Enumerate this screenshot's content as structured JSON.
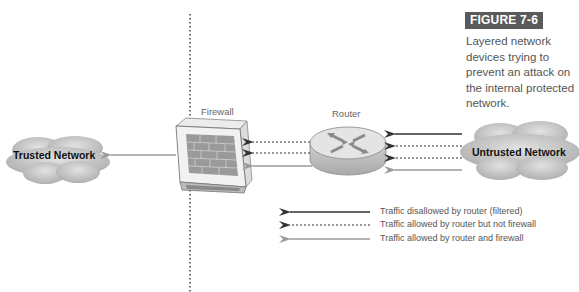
{
  "figure": {
    "label": "FIGURE 7-6",
    "caption": "Layered network devices trying to prevent an attack on the internal protected network."
  },
  "nodes": {
    "trusted_network": {
      "label": "Trusted Network",
      "icon": "cloud-icon"
    },
    "firewall": {
      "label": "Firewall",
      "icon": "firewall-brick-wall-icon"
    },
    "router": {
      "label": "Router",
      "icon": "router-icon"
    },
    "untrusted_network": {
      "label": "Untrusted Network",
      "icon": "cloud-icon"
    }
  },
  "legend": [
    {
      "label": "Traffic disallowed by router (filtered)",
      "style": "solid",
      "color": "#333333"
    },
    {
      "label": "Traffic allowed by router but not firewall",
      "style": "dashed",
      "color": "#333333"
    },
    {
      "label": "Traffic allowed by router and firewall",
      "style": "solid",
      "color": "#999999"
    }
  ],
  "flows": {
    "untrusted_to_router": [
      "disallowed",
      "allowed_not_firewall",
      "allowed_not_firewall",
      "allowed_both"
    ],
    "router_to_firewall": [
      "allowed_not_firewall",
      "allowed_not_firewall",
      "allowed_both"
    ],
    "firewall_to_trusted": [
      "allowed_both"
    ]
  },
  "colors": {
    "dark_arrow": "#333333",
    "light_arrow": "#999999",
    "figure_label_bg": "#5a5a5a",
    "caption_text": "#555555"
  }
}
